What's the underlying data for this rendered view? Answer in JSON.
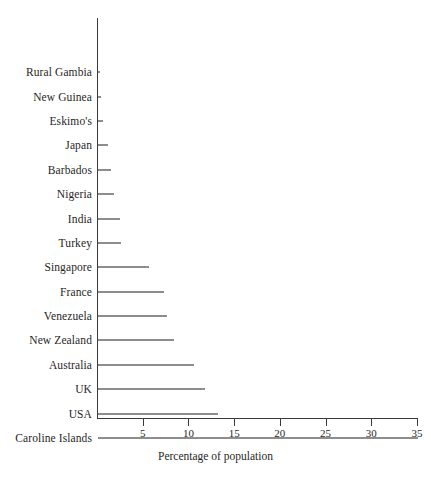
{
  "chart_data": {
    "type": "bar",
    "orientation": "horizontal",
    "title": "",
    "xlabel": "Percentage of population",
    "ylabel": "",
    "xlim": [
      0,
      35
    ],
    "xticks": [
      5,
      10,
      15,
      20,
      25,
      30,
      35
    ],
    "grid": false,
    "legend": null,
    "bar_color": "#8d8d8d",
    "axis_color": "#3a3a3a",
    "categories": [
      "Rural Gambia",
      "New Guinea",
      "Eskimo's",
      "Japan",
      "Barbados",
      "Nigeria",
      "India",
      "Turkey",
      "Singapore",
      "France",
      "Venezuela",
      "New Zealand",
      "Australia",
      "UK",
      "USA",
      "Caroline Islands"
    ],
    "values": [
      0.2,
      0.3,
      0.6,
      1.1,
      1.4,
      1.7,
      2.4,
      2.5,
      5.6,
      7.2,
      7.6,
      8.3,
      10.5,
      11.7,
      13.1,
      35.0
    ]
  },
  "axis": {
    "x_title": "Percentage of population",
    "tick_labels": [
      "5",
      "10",
      "15",
      "20",
      "25",
      "30",
      "35"
    ]
  },
  "caption": {
    "partial_text": ""
  }
}
